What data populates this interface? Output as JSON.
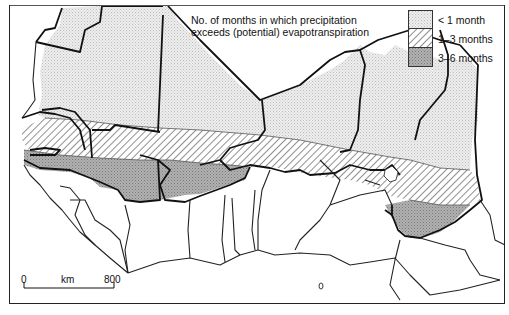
{
  "map": {
    "title_line1": "No. of months in which precipitation",
    "title_line2": "exceeds (potential) evapotranspiration",
    "legend": [
      {
        "label": "< 1 month",
        "pattern": "dots",
        "color": "#ececec"
      },
      {
        "label": "1–3 months",
        "pattern": "hatch",
        "color": "#ffffff"
      },
      {
        "label": "3–6 months",
        "pattern": "dark-dots",
        "color": "#a9a9a9"
      }
    ],
    "scale_bar": {
      "start": "0",
      "unit": "km",
      "end": "800"
    },
    "region": "West Africa (Sahel)"
  }
}
